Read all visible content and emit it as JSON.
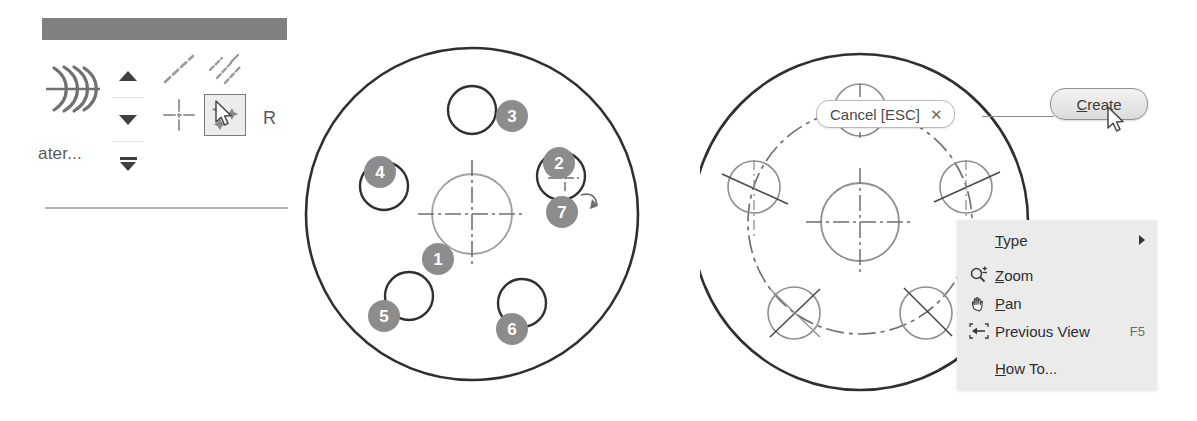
{
  "page": {
    "background": "#ffffff",
    "width": 1197,
    "height": 421,
    "line_color": "#3d3d3d",
    "construction_color": "#9a9a9a",
    "badge_color": "#8c8c8c",
    "badge_text_color": "#ffffff",
    "menu_background": "#ebebeb",
    "header_bar_color": "#808080"
  },
  "toolbar": {
    "header_bar_label": "",
    "pattern_icon": "circular-pattern-icon",
    "truncated_label": "ater...",
    "spinner": {
      "up_label": "move-up",
      "down_label": "move-down",
      "bottom_label": "move-to-bottom"
    },
    "icons": [
      {
        "name": "dashed-diagonal-line-icon",
        "selected": false
      },
      {
        "name": "multiple-diagonal-dashes-icon",
        "selected": false
      },
      {
        "name": "center-mark-crosshair-icon",
        "selected": false
      },
      {
        "name": "sketch-points-pattern-icon",
        "selected": true
      }
    ],
    "cursor_hint_letter": "R"
  },
  "flange": {
    "caption": "",
    "outer_circle": {
      "cx": 176,
      "cy": 186,
      "r": 166
    },
    "center_hole": {
      "cx": 176,
      "cy": 186,
      "r": 40
    },
    "holes": [
      {
        "id": 3,
        "cx": 176,
        "cy": 82,
        "r": 24,
        "badge_x": 200,
        "badge_y": 72
      },
      {
        "id": 2,
        "cx": 265,
        "cy": 148,
        "r": 24,
        "badge_x": 247,
        "badge_y": 119
      },
      {
        "id": 4,
        "cx": 88,
        "cy": 158,
        "r": 24,
        "badge_x": 68,
        "badge_y": 128
      },
      {
        "id": 5,
        "cx": 113,
        "cy": 268,
        "r": 24,
        "badge_x": 72,
        "badge_y": 272
      },
      {
        "id": 6,
        "cx": 226,
        "cy": 275,
        "r": 24,
        "badge_x": 200,
        "badge_y": 285
      },
      {
        "id": 1,
        "cx": 176,
        "cy": 186,
        "r": 40,
        "badge_x": 126,
        "badge_y": 215
      },
      {
        "id": 7,
        "cx": 265,
        "cy": 148,
        "r": 24,
        "badge_x": 250,
        "badge_y": 168
      }
    ],
    "badge_labels": [
      "1",
      "2",
      "3",
      "4",
      "5",
      "6",
      "7"
    ],
    "rotation_arrow": "rotate-arrow-icon"
  },
  "preview": {
    "outer_circle": {
      "cx": 160,
      "cy": 196,
      "r": 168
    },
    "bolt_circle": {
      "cx": 160,
      "cy": 196,
      "r": 112,
      "style": "dash-dot"
    },
    "center_hole": {
      "cx": 160,
      "cy": 196,
      "r": 39
    },
    "preview_holes": [
      {
        "cx": 160,
        "cy": 84,
        "r": 26
      },
      {
        "cx": 266,
        "cy": 161,
        "r": 26
      },
      {
        "cx": 226,
        "cy": 287,
        "r": 26
      },
      {
        "cx": 94,
        "cy": 287,
        "r": 26
      },
      {
        "cx": 54,
        "cy": 161,
        "r": 26
      }
    ],
    "cancel_pill": {
      "label": "Cancel [ESC]",
      "close_icon": "close-x-icon",
      "close_glyph": "✕"
    },
    "create_button": {
      "label": "Create",
      "mnemonic": "C",
      "rest_label": "reate",
      "cursor": "mouse-pointer-icon"
    },
    "context_menu": {
      "items": [
        {
          "label": "Type",
          "mnemonic": "T",
          "rest": "ype",
          "icon": "",
          "accel": "",
          "submenu": true
        },
        {
          "label": "Zoom",
          "mnemonic": "Z",
          "rest": "oom",
          "icon": "zoom-magnifier-icon",
          "accel": "",
          "submenu": false
        },
        {
          "label": "Pan",
          "mnemonic": "P",
          "rest": "an",
          "icon": "pan-hand-icon",
          "accel": "",
          "submenu": false
        },
        {
          "label": "Previous View",
          "mnemonic": "",
          "rest": "Previous View",
          "icon": "previous-view-icon",
          "accel": "F5",
          "submenu": false
        },
        {
          "label": "How To...",
          "mnemonic": "H",
          "rest": "ow To...",
          "icon": "",
          "accel": "",
          "submenu": false
        }
      ]
    }
  }
}
